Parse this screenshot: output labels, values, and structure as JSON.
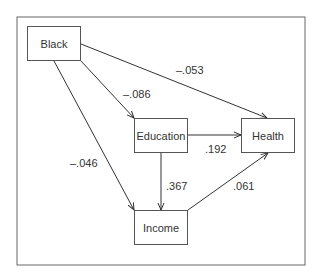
{
  "diagram": {
    "type": "path-diagram",
    "nodes": {
      "black": "Black",
      "education": "Education",
      "health": "Health",
      "income": "Income"
    },
    "edges": [
      {
        "from": "Black",
        "to": "Health",
        "coef": "–.053"
      },
      {
        "from": "Black",
        "to": "Education",
        "coef": "–.086"
      },
      {
        "from": "Black",
        "to": "Income",
        "coef": "–.046"
      },
      {
        "from": "Education",
        "to": "Health",
        "coef": ".192"
      },
      {
        "from": "Education",
        "to": "Income",
        "coef": ".367"
      },
      {
        "from": "Income",
        "to": "Health",
        "coef": ".061"
      }
    ]
  }
}
